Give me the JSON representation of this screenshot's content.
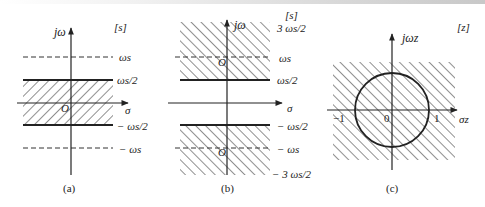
{
  "panels": [
    {
      "id": "a",
      "caption": "(a)",
      "plane_label": "[s]",
      "vertical_axis_label": "jω",
      "horizontal_axis_label": "σ",
      "origin_label": "O",
      "hatch_direction": "forward-slash",
      "hatched_region": "-ωs/2 < ω < ωs/2 (primary strip)",
      "lines": [
        {
          "label": "ωs",
          "style": "dashed"
        },
        {
          "label": "ωs/2",
          "style": "solid"
        },
        {
          "label": "− ωs/2",
          "style": "solid"
        },
        {
          "label": "− ωs",
          "style": "dashed"
        }
      ]
    },
    {
      "id": "b",
      "caption": "(b)",
      "plane_label": "[s]",
      "vertical_axis_label": "jω",
      "horizontal_axis_label": "σ",
      "origin_labels": [
        "O",
        "O"
      ],
      "hatch_direction": "back-slash",
      "hatched_region": "ωs/2 < |ω| < 3ωs/2 (complementary strips)",
      "lines": [
        {
          "label": "3 ωs/2",
          "style": "edge"
        },
        {
          "label": "ωs",
          "style": "dashed"
        },
        {
          "label": "ωs/2",
          "style": "solid"
        },
        {
          "label": "− ωs/2",
          "style": "solid"
        },
        {
          "label": "− ωs",
          "style": "dashed"
        },
        {
          "label": "− 3 ωs/2",
          "style": "edge"
        }
      ]
    },
    {
      "id": "c",
      "caption": "(c)",
      "plane_label": "[z]",
      "vertical_axis_label": "jωz",
      "horizontal_axis_label": "σz",
      "hatch_direction": "back-slash",
      "hatched_region": "entire z-plane",
      "circle": "unit circle",
      "tick_labels": [
        "−1",
        "0",
        "1"
      ]
    }
  ],
  "labels": {
    "a_jw": "jω",
    "a_s": "[s]",
    "a_ws": "ωs",
    "a_ws2": "ωs/2",
    "a_sigma": "σ",
    "a_O": "O",
    "a_mws2": "− ωs/2",
    "a_mws": "− ωs",
    "a_caption": "(a)",
    "b_jw": "jω",
    "b_s": "[s]",
    "b_3ws2": "3 ωs/2",
    "b_ws": "ωs",
    "b_ws2": "ωs/2",
    "b_sigma": "σ",
    "b_O1": "O",
    "b_O2": "O",
    "b_mws2": "− ωs/2",
    "b_mws": "− ωs",
    "b_m3ws2": "− 3 ωs/2",
    "b_caption": "(b)",
    "c_jwz": "jωz",
    "c_z": "[z]",
    "c_m1": "−1",
    "c_0": "0",
    "c_1": "1",
    "c_sigmaz": "σz",
    "c_caption": "(c)"
  },
  "colors": {
    "ink": "#222222",
    "background": "#ffffff"
  }
}
